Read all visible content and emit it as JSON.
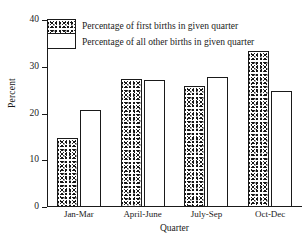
{
  "chart_data": {
    "type": "bar",
    "title": "",
    "xlabel": "Quarter",
    "ylabel": "Percent",
    "categories": [
      "Jan-Mar",
      "April-June",
      "July-Sep",
      "Oct-Dec"
    ],
    "series": [
      {
        "name": "Percentage of first births in given quarter",
        "values": [
          14.8,
          27.4,
          25.9,
          33.4
        ]
      },
      {
        "name": "Percentage of all other births in given quarter",
        "values": [
          20.8,
          27.2,
          27.8,
          24.8
        ]
      }
    ],
    "ylim": [
      0,
      40
    ],
    "yticks": [
      0,
      10,
      20,
      30,
      40
    ],
    "ytick_labels": [
      "0",
      "10",
      "20",
      "30",
      "40"
    ],
    "grid": false,
    "legend_position": "top-left"
  },
  "legend": {
    "items": [
      {
        "label": "Percentage of first births in given quarter",
        "swatch": "stippled"
      },
      {
        "label": "Percentage of all other births in given quarter",
        "swatch": "open"
      }
    ]
  },
  "colors": {
    "axis": "#1a1a1a",
    "stipple": "#151515",
    "open_fill": "#ffffff",
    "background": "#ffffff"
  }
}
